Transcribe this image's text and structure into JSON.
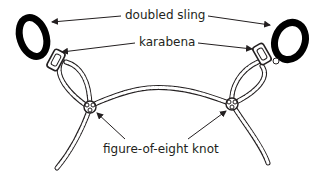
{
  "diagram": {
    "type": "labelled-illustration",
    "labels": {
      "sling": "doubled sling",
      "karabena": "karabena",
      "knot": "figure-of-eight knot"
    },
    "colors": {
      "ink": "#231f20",
      "background": "#ffffff",
      "sling_fill": "#000000"
    },
    "components": [
      {
        "id": "left-sling",
        "label": "doubled sling"
      },
      {
        "id": "right-sling",
        "label": "doubled sling"
      },
      {
        "id": "left-karabena",
        "label": "karabena"
      },
      {
        "id": "right-karabena",
        "label": "karabena"
      },
      {
        "id": "left-knot",
        "label": "figure-of-eight knot"
      },
      {
        "id": "right-knot",
        "label": "figure-of-eight knot"
      }
    ]
  }
}
